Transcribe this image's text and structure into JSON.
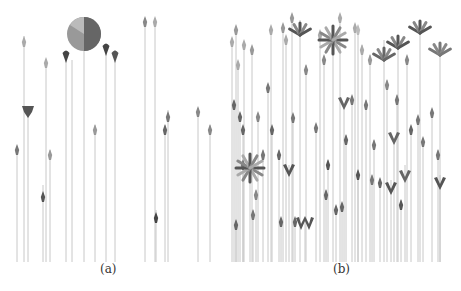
{
  "figure": {
    "panels": [
      {
        "id": "a",
        "caption": "(a)",
        "baseline_y": 262,
        "stems": [
          {
            "x": 17,
            "top": 150,
            "glyph": "arrow",
            "gy": 150,
            "shade": "#777"
          },
          {
            "x": 24,
            "top": 36,
            "glyph": "arrow",
            "gy": 42,
            "shade": "#aaa"
          },
          {
            "x": 28,
            "top": 108,
            "glyph": "shield",
            "gy": 110,
            "shade": "#555"
          },
          {
            "x": 43,
            "top": 185,
            "glyph": "arrow",
            "gy": 197,
            "shade": "#555"
          },
          {
            "x": 46,
            "top": 60,
            "glyph": "arrow",
            "gy": 63,
            "shade": "#aaa"
          },
          {
            "x": 50,
            "top": 150,
            "glyph": "arrow",
            "gy": 155,
            "shade": "#999"
          },
          {
            "x": 66,
            "top": 52,
            "glyph": "drop",
            "gy": 57,
            "shade": "#444"
          },
          {
            "x": 72,
            "top": 60,
            "glyph": "none",
            "gy": 0,
            "shade": "#bbb"
          },
          {
            "x": 84,
            "top": 50,
            "glyph": "circle",
            "gy": 34,
            "shade": "#888"
          },
          {
            "x": 95,
            "top": 125,
            "glyph": "arrow",
            "gy": 130,
            "shade": "#999"
          },
          {
            "x": 106,
            "top": 45,
            "glyph": "drop",
            "gy": 50,
            "shade": "#444"
          },
          {
            "x": 115,
            "top": 50,
            "glyph": "drop",
            "gy": 57,
            "shade": "#555"
          },
          {
            "x": 145,
            "top": 18,
            "glyph": "arrow",
            "gy": 22,
            "shade": "#888"
          },
          {
            "x": 155,
            "top": 18,
            "glyph": "arrow",
            "gy": 22,
            "shade": "#aaa"
          },
          {
            "x": 156,
            "top": 210,
            "glyph": "arrow",
            "gy": 218,
            "shade": "#444"
          },
          {
            "x": 165,
            "top": 125,
            "glyph": "arrow",
            "gy": 130,
            "shade": "#666"
          },
          {
            "x": 168,
            "top": 110,
            "glyph": "arrow",
            "gy": 117,
            "shade": "#777"
          },
          {
            "x": 198,
            "top": 108,
            "glyph": "arrow",
            "gy": 112,
            "shade": "#888"
          },
          {
            "x": 210,
            "top": 125,
            "glyph": "arrow",
            "gy": 130,
            "shade": "#888"
          }
        ]
      },
      {
        "id": "b",
        "caption": "(b)",
        "baseline_y": 262,
        "stems": [
          {
            "x": 232,
            "top": 40,
            "glyph": "arrow",
            "gy": 42,
            "shade": "#aaa"
          },
          {
            "x": 234,
            "top": 100,
            "glyph": "arrow",
            "gy": 105,
            "shade": "#666"
          },
          {
            "x": 236,
            "top": 220,
            "glyph": "arrow",
            "gy": 225,
            "shade": "#666"
          },
          {
            "x": 236,
            "top": 30,
            "glyph": "arrow",
            "gy": 30,
            "shade": "#999"
          },
          {
            "x": 238,
            "top": 62,
            "glyph": "arrow",
            "gy": 65,
            "shade": "#aaa"
          },
          {
            "x": 240,
            "top": 115,
            "glyph": "arrow",
            "gy": 117,
            "shade": "#666"
          },
          {
            "x": 243,
            "top": 160,
            "glyph": "arrow",
            "gy": 165,
            "shade": "#777"
          },
          {
            "x": 250,
            "top": 165,
            "glyph": "star",
            "gy": 168,
            "shade": "#666"
          },
          {
            "x": 243,
            "top": 128,
            "glyph": "arrow",
            "gy": 130,
            "shade": "#666"
          },
          {
            "x": 244,
            "top": 45,
            "glyph": "arrow",
            "gy": 45,
            "shade": "#aaa"
          },
          {
            "x": 252,
            "top": 48,
            "glyph": "arrow",
            "gy": 50,
            "shade": "#999"
          },
          {
            "x": 253,
            "top": 210,
            "glyph": "arrow",
            "gy": 215,
            "shade": "#777"
          },
          {
            "x": 256,
            "top": 190,
            "glyph": "arrow",
            "gy": 195,
            "shade": "#888"
          },
          {
            "x": 258,
            "top": 115,
            "glyph": "arrow",
            "gy": 117,
            "shade": "#888"
          },
          {
            "x": 263,
            "top": 150,
            "glyph": "arrow",
            "gy": 155,
            "shade": "#777"
          },
          {
            "x": 268,
            "top": 85,
            "glyph": "arrow",
            "gy": 88,
            "shade": "#777"
          },
          {
            "x": 271,
            "top": 30,
            "glyph": "arrow",
            "gy": 30,
            "shade": "#aaa"
          },
          {
            "x": 272,
            "top": 130,
            "glyph": "arrow",
            "gy": 130,
            "shade": "#666"
          },
          {
            "x": 279,
            "top": 150,
            "glyph": "arrow",
            "gy": 155,
            "shade": "#666"
          },
          {
            "x": 281,
            "top": 220,
            "glyph": "arrow",
            "gy": 222,
            "shade": "#666"
          },
          {
            "x": 283,
            "top": 30,
            "glyph": "arrow",
            "gy": 28,
            "shade": "#999"
          },
          {
            "x": 286,
            "top": 40,
            "glyph": "arrow",
            "gy": 40,
            "shade": "#aaa"
          },
          {
            "x": 289,
            "top": 165,
            "glyph": "vleaf",
            "gy": 172,
            "shade": "#555"
          },
          {
            "x": 292,
            "top": 20,
            "glyph": "arrow",
            "gy": 18,
            "shade": "#999"
          },
          {
            "x": 293,
            "top": 118,
            "glyph": "arrow",
            "gy": 118,
            "shade": "#777"
          },
          {
            "x": 295,
            "top": 220,
            "glyph": "arrow",
            "gy": 222,
            "shade": "#666"
          },
          {
            "x": 300,
            "top": 20,
            "glyph": "leaf",
            "gy": 35,
            "shade": "#555"
          },
          {
            "x": 305,
            "top": 220,
            "glyph": "wleaf",
            "gy": 225,
            "shade": "#555"
          },
          {
            "x": 306,
            "top": 65,
            "glyph": "arrow",
            "gy": 70,
            "shade": "#888"
          },
          {
            "x": 316,
            "top": 125,
            "glyph": "arrow",
            "gy": 128,
            "shade": "#777"
          },
          {
            "x": 320,
            "top": 35,
            "glyph": "arrow",
            "gy": 35,
            "shade": "#aaa"
          },
          {
            "x": 324,
            "top": 60,
            "glyph": "arrow",
            "gy": 60,
            "shade": "#888"
          },
          {
            "x": 326,
            "top": 190,
            "glyph": "arrow",
            "gy": 195,
            "shade": "#666"
          },
          {
            "x": 328,
            "top": 160,
            "glyph": "arrow",
            "gy": 165,
            "shade": "#555"
          },
          {
            "x": 333,
            "top": 40,
            "glyph": "star",
            "gy": 40,
            "shade": "#999"
          },
          {
            "x": 336,
            "top": 210,
            "glyph": "arrow",
            "gy": 210,
            "shade": "#666"
          },
          {
            "x": 340,
            "top": 20,
            "glyph": "arrow",
            "gy": 18,
            "shade": "#aaa"
          },
          {
            "x": 342,
            "top": 205,
            "glyph": "arrow",
            "gy": 207,
            "shade": "#666"
          },
          {
            "x": 344,
            "top": 105,
            "glyph": "vleaf",
            "gy": 105,
            "shade": "#666"
          },
          {
            "x": 346,
            "top": 135,
            "glyph": "arrow",
            "gy": 140,
            "shade": "#666"
          },
          {
            "x": 352,
            "top": 100,
            "glyph": "arrow",
            "gy": 100,
            "shade": "#777"
          },
          {
            "x": 355,
            "top": 25,
            "glyph": "arrow",
            "gy": 28,
            "shade": "#aaa"
          },
          {
            "x": 358,
            "top": 170,
            "glyph": "arrow",
            "gy": 175,
            "shade": "#555"
          },
          {
            "x": 358,
            "top": 30,
            "glyph": "arrow",
            "gy": 30,
            "shade": "#bbb"
          },
          {
            "x": 362,
            "top": 45,
            "glyph": "arrow",
            "gy": 50,
            "shade": "#aaa"
          },
          {
            "x": 366,
            "top": 100,
            "glyph": "arrow",
            "gy": 105,
            "shade": "#777"
          },
          {
            "x": 370,
            "top": 55,
            "glyph": "arrow",
            "gy": 60,
            "shade": "#999"
          },
          {
            "x": 372,
            "top": 175,
            "glyph": "arrow",
            "gy": 180,
            "shade": "#777"
          },
          {
            "x": 374,
            "top": 140,
            "glyph": "arrow",
            "gy": 145,
            "shade": "#777"
          },
          {
            "x": 380,
            "top": 180,
            "glyph": "arrow",
            "gy": 183,
            "shade": "#666"
          },
          {
            "x": 384,
            "top": 40,
            "glyph": "leaf",
            "gy": 60,
            "shade": "#666"
          },
          {
            "x": 387,
            "top": 80,
            "glyph": "arrow",
            "gy": 85,
            "shade": "#888"
          },
          {
            "x": 391,
            "top": 180,
            "glyph": "vleaf",
            "gy": 190,
            "shade": "#555"
          },
          {
            "x": 394,
            "top": 140,
            "glyph": "vleaf",
            "gy": 140,
            "shade": "#666"
          },
          {
            "x": 397,
            "top": 95,
            "glyph": "arrow",
            "gy": 100,
            "shade": "#777"
          },
          {
            "x": 398,
            "top": 40,
            "glyph": "leaf",
            "gy": 48,
            "shade": "#555"
          },
          {
            "x": 401,
            "top": 200,
            "glyph": "arrow",
            "gy": 205,
            "shade": "#555"
          },
          {
            "x": 405,
            "top": 165,
            "glyph": "vleaf",
            "gy": 178,
            "shade": "#666"
          },
          {
            "x": 407,
            "top": 60,
            "glyph": "arrow",
            "gy": 60,
            "shade": "#888"
          },
          {
            "x": 411,
            "top": 130,
            "glyph": "arrow",
            "gy": 130,
            "shade": "#666"
          },
          {
            "x": 418,
            "top": 120,
            "glyph": "arrow",
            "gy": 120,
            "shade": "#777"
          },
          {
            "x": 420,
            "top": 25,
            "glyph": "leaf",
            "gy": 33,
            "shade": "#555"
          },
          {
            "x": 423,
            "top": 140,
            "glyph": "arrow",
            "gy": 142,
            "shade": "#777"
          },
          {
            "x": 432,
            "top": 110,
            "glyph": "arrow",
            "gy": 113,
            "shade": "#777"
          },
          {
            "x": 438,
            "top": 150,
            "glyph": "arrow",
            "gy": 155,
            "shade": "#777"
          },
          {
            "x": 440,
            "top": 50,
            "glyph": "leaf",
            "gy": 55,
            "shade": "#777"
          },
          {
            "x": 440,
            "top": 175,
            "glyph": "vleaf",
            "gy": 185,
            "shade": "#555"
          }
        ]
      }
    ]
  }
}
